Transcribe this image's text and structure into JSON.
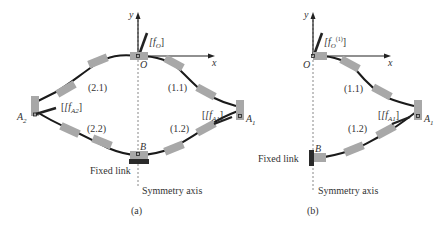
{
  "panel_a": {
    "caption": "(a)",
    "axis_y": "y",
    "axis_x": "x",
    "origin": "O",
    "force_origin": "[f",
    "force_origin_sub": "O",
    "force_origin_close": "]",
    "chain_labels": [
      "(2.1)",
      "(1.1)",
      "(2.2)",
      "(1.2)"
    ],
    "node_a2": "A",
    "node_a2_sub": "2",
    "node_a1": "A",
    "node_a1_sub": "1",
    "node_b": "B",
    "force_a2": "[f",
    "force_a2_sub": "A2",
    "force_a1": "[f",
    "force_a1_sub": "A1",
    "fixed_link": "Fixed link",
    "symmetry_axis": "Symmetry axis"
  },
  "panel_b": {
    "caption": "(b)",
    "axis_y": "y",
    "axis_x": "x",
    "origin": "O",
    "force_origin": "[f",
    "force_origin_sub": "O",
    "force_origin_sup": "(1)",
    "force_origin_close": "]",
    "chain_labels": [
      "(1.1)",
      "(1.2)"
    ],
    "node_a1": "A",
    "node_a1_sub": "1",
    "node_b": "B",
    "force_a1": "[f",
    "force_a1_sub": "A1",
    "fixed_link": "Fixed link",
    "symmetry_axis": "Symmetry axis"
  },
  "colors": {
    "segment": "#a8a8a8",
    "wire": "#1a1a1a",
    "fixed": "#2a2a2a",
    "axis_dash": "#777777"
  }
}
